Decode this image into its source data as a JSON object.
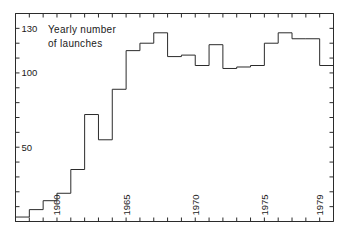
{
  "chart_data": {
    "type": "line",
    "subtype": "step-post",
    "title": "Yearly number of launches",
    "title_line1": "Yearly number",
    "title_line2": "of launches",
    "xlabel": "",
    "ylabel": "",
    "grid": false,
    "legend": null,
    "xlim": [
      1957,
      1980
    ],
    "ylim": [
      0,
      140
    ],
    "y_tick_step": 10,
    "y_ticks": [
      0,
      10,
      20,
      30,
      40,
      50,
      60,
      70,
      80,
      90,
      100,
      110,
      120,
      130,
      140
    ],
    "y_tick_labels": [
      {
        "value": 50,
        "label": "50"
      },
      {
        "value": 100,
        "label": "100"
      },
      {
        "value": 130,
        "label": "130"
      }
    ],
    "x_ticks": [
      1957,
      1958,
      1959,
      1960,
      1961,
      1962,
      1963,
      1964,
      1965,
      1966,
      1967,
      1968,
      1969,
      1970,
      1971,
      1972,
      1973,
      1974,
      1975,
      1976,
      1977,
      1978,
      1979
    ],
    "x_tick_labels": [
      {
        "value": 1960,
        "label": "1960"
      },
      {
        "value": 1965,
        "label": "1965"
      },
      {
        "value": 1970,
        "label": "1970"
      },
      {
        "value": 1975,
        "label": "1975"
      },
      {
        "value": 1979,
        "label": "1979"
      }
    ],
    "categories": [
      1957,
      1958,
      1959,
      1960,
      1961,
      1962,
      1963,
      1964,
      1965,
      1966,
      1967,
      1968,
      1969,
      1970,
      1971,
      1972,
      1973,
      1974,
      1975,
      1976,
      1977,
      1978,
      1979
    ],
    "values": [
      3,
      8,
      14,
      19,
      35,
      72,
      55,
      89,
      115,
      120,
      127,
      111,
      112,
      105,
      119,
      103,
      104,
      105,
      120,
      127,
      123,
      123,
      105
    ],
    "series": [
      {
        "name": "Yearly number of launches",
        "color": "#2b2b2b",
        "points": [
          {
            "year": 1957,
            "value": 3
          },
          {
            "year": 1958,
            "value": 8
          },
          {
            "year": 1959,
            "value": 14
          },
          {
            "year": 1960,
            "value": 19
          },
          {
            "year": 1961,
            "value": 35
          },
          {
            "year": 1962,
            "value": 72
          },
          {
            "year": 1963,
            "value": 55
          },
          {
            "year": 1964,
            "value": 89
          },
          {
            "year": 1965,
            "value": 115
          },
          {
            "year": 1966,
            "value": 120
          },
          {
            "year": 1967,
            "value": 127
          },
          {
            "year": 1968,
            "value": 111
          },
          {
            "year": 1969,
            "value": 112
          },
          {
            "year": 1970,
            "value": 105
          },
          {
            "year": 1971,
            "value": 119
          },
          {
            "year": 1972,
            "value": 103
          },
          {
            "year": 1973,
            "value": 104
          },
          {
            "year": 1974,
            "value": 105
          },
          {
            "year": 1975,
            "value": 120
          },
          {
            "year": 1976,
            "value": 127
          },
          {
            "year": 1977,
            "value": 123
          },
          {
            "year": 1978,
            "value": 123
          },
          {
            "year": 1979,
            "value": 105
          }
        ]
      }
    ],
    "annotations": [],
    "colors": {
      "line": "#2b2b2b",
      "axis": "#2b2b2b",
      "text": "#1a1a1a",
      "background": "#ffffff"
    }
  }
}
